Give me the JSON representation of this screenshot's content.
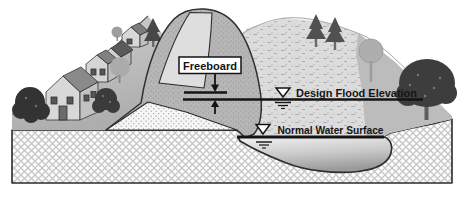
{
  "diagram": {
    "type": "dam-freeboard-cross-section",
    "labels": {
      "freeboard": "Freeboard",
      "design_flood_elevation": "Design Flood Elevation",
      "normal_water_surface": "Normal Water Surface"
    },
    "icons": {
      "design_flood_marker": "water-level-triangle-icon",
      "normal_water_marker": "water-level-triangle-icon",
      "freeboard_arrow_down": "arrow-down-icon",
      "freeboard_arrow_up": "arrow-up-icon"
    },
    "colors": {
      "annotation": "#141414",
      "label_box_background": "#ffffff",
      "outline": "#2e2e2e",
      "dam_shell": "#b6b6b6",
      "dam_core": "#f6f6f6",
      "road": "#dedede",
      "village_hill": "#bdbdbd",
      "reservoir_hillside": "#dcdcdc",
      "water_top": "#f1f1f1",
      "water_bottom": "#9b9b9b",
      "foundation_hatch": "#c6c6c6",
      "tree_dark": "#3d3d3d"
    }
  }
}
